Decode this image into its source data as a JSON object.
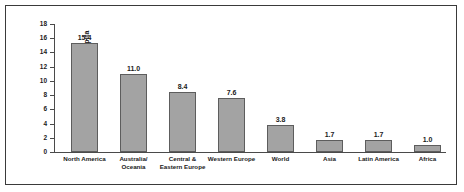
{
  "chart_data": {
    "type": "bar",
    "title": "",
    "xlabel": "",
    "ylabel": "Tons per capita",
    "ylim": [
      0,
      18
    ],
    "ytick_step": 2,
    "yticks": [
      0,
      2,
      4,
      6,
      8,
      10,
      12,
      14,
      16,
      18
    ],
    "grid": false,
    "legend": false,
    "bar_color": "#a3a3a3",
    "bar_border_color": "#5d5d5d",
    "frame_color": "#3a3a3a",
    "axis_color": "#4a4a4a",
    "text_color": "#1a1a1a",
    "categories": [
      "North America",
      "Australia/Oceania",
      "Central & Eastern Europe",
      "Western Europe",
      "World",
      "Asia",
      "Latin America",
      "Africa"
    ],
    "category_lines": [
      [
        "North America"
      ],
      [
        "Australia/",
        "Oceania"
      ],
      [
        "Central &",
        "Eastern Europe"
      ],
      [
        "Western Europe"
      ],
      [
        "World"
      ],
      [
        "Asia"
      ],
      [
        "Latin America"
      ],
      [
        "Africa"
      ]
    ],
    "values": [
      15.4,
      11.0,
      8.4,
      7.6,
      3.8,
      1.7,
      1.7,
      1.0
    ],
    "value_labels": [
      "15.4",
      "11.0",
      "8.4",
      "7.6",
      "3.8",
      "1.7",
      "1.7",
      "1.0"
    ]
  }
}
